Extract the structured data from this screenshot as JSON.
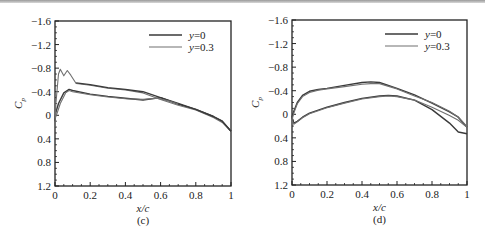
{
  "chart_data": [
    {
      "type": "line",
      "panel_label": "(c)",
      "xlabel": "x/c",
      "ylabel": "C_p",
      "xlim": [
        0,
        1
      ],
      "ylim": [
        -1.6,
        1.2
      ],
      "y_inverted": true,
      "x_ticks": [
        "0",
        "0.2",
        "0.4",
        "0.6",
        "0.8",
        "1"
      ],
      "y_ticks": [
        "-1.6",
        "-1.2",
        "-0.8",
        "-0.4",
        "0",
        "0.4",
        "0.8",
        "1.2"
      ],
      "grid": false,
      "legend_position": "upper right",
      "series": [
        {
          "name": "y=0",
          "color": "#3a3a3a",
          "width": 1.4,
          "x": [
            0,
            0.005,
            0.02,
            0.05,
            0.08,
            0.1,
            0.2,
            0.3,
            0.4,
            0.5,
            0.6,
            0.7,
            0.8,
            0.9,
            0.95,
            1.0
          ],
          "y": [
            0.1,
            -0.05,
            -0.2,
            -0.38,
            -0.44,
            -0.42,
            -0.36,
            -0.32,
            -0.29,
            -0.26,
            -0.3,
            -0.19,
            -0.1,
            0.02,
            0.1,
            0.27
          ]
        },
        {
          "name": "y=0.3",
          "color": "#707070",
          "width": 1.1,
          "x": [
            0,
            0.005,
            0.02,
            0.03,
            0.05,
            0.07,
            0.09,
            0.12,
            0.2,
            0.3,
            0.4,
            0.5,
            0.6,
            0.7,
            0.8,
            0.9,
            0.95,
            1.0
          ],
          "y": [
            0.2,
            -0.2,
            -0.7,
            -0.78,
            -0.67,
            -0.76,
            -0.68,
            -0.54,
            -0.51,
            -0.46,
            -0.43,
            -0.38,
            -0.27,
            -0.17,
            -0.09,
            0.04,
            0.12,
            0.27
          ]
        },
        {
          "name": "y=0 upper",
          "color": "#3a3a3a",
          "width": 1.4,
          "legend": false,
          "x": [
            0.12,
            0.2,
            0.3,
            0.4,
            0.5,
            0.6,
            0.7,
            0.8,
            0.9,
            0.95,
            1.0
          ],
          "y": [
            -0.55,
            -0.52,
            -0.47,
            -0.44,
            -0.4,
            -0.3,
            -0.2,
            -0.1,
            0.02,
            0.1,
            0.27
          ]
        },
        {
          "name": "y=0.3 lower",
          "color": "#707070",
          "width": 1.1,
          "legend": false,
          "x": [
            0,
            0.01,
            0.03,
            0.06,
            0.08,
            0.1,
            0.2,
            0.3,
            0.4,
            0.5,
            0.58,
            0.65,
            0.7
          ],
          "y": [
            0.05,
            -0.02,
            -0.2,
            -0.38,
            -0.42,
            -0.4,
            -0.35,
            -0.31,
            -0.28,
            -0.27,
            -0.29,
            -0.24,
            -0.19
          ]
        }
      ]
    },
    {
      "type": "line",
      "panel_label": "(d)",
      "xlabel": "x/c",
      "ylabel": "C_p",
      "xlim": [
        0,
        1
      ],
      "ylim": [
        -1.6,
        1.2
      ],
      "y_inverted": true,
      "x_ticks": [
        "0",
        "0.2",
        "0.4",
        "0.6",
        "0.8",
        "1"
      ],
      "y_ticks": [
        "-1.6",
        "-1.2",
        "-0.8",
        "-0.4",
        "0",
        "0.4",
        "0.8",
        "1.2"
      ],
      "grid": false,
      "legend_position": "upper right",
      "series": [
        {
          "name": "y=0",
          "color": "#3a3a3a",
          "width": 1.4,
          "x": [
            0,
            0.01,
            0.03,
            0.06,
            0.1,
            0.15,
            0.2,
            0.3,
            0.4,
            0.45,
            0.5,
            0.6,
            0.7,
            0.8,
            0.9,
            0.95,
            1.0
          ],
          "y": [
            0.05,
            -0.05,
            -0.2,
            -0.32,
            -0.39,
            -0.42,
            -0.44,
            -0.49,
            -0.54,
            -0.55,
            -0.54,
            -0.44,
            -0.33,
            -0.19,
            -0.04,
            0.05,
            0.22
          ],
          "lower_x": [
            0,
            0.01,
            0.03,
            0.06,
            0.1,
            0.2,
            0.3,
            0.4,
            0.5,
            0.55,
            0.6,
            0.7,
            0.8,
            0.9,
            0.95,
            1.0
          ],
          "lower_y": [
            0.05,
            0.15,
            0.12,
            0.05,
            -0.02,
            -0.12,
            -0.2,
            -0.27,
            -0.31,
            -0.32,
            -0.31,
            -0.24,
            -0.08,
            0.15,
            0.3,
            0.33
          ]
        },
        {
          "name": "y=0.3",
          "color": "#707070",
          "width": 1.1,
          "x": [
            0,
            0.01,
            0.03,
            0.06,
            0.1,
            0.15,
            0.2,
            0.3,
            0.4,
            0.45,
            0.5,
            0.6,
            0.7,
            0.8,
            0.9,
            0.95,
            1.0
          ],
          "y": [
            0.1,
            -0.02,
            -0.18,
            -0.3,
            -0.37,
            -0.41,
            -0.43,
            -0.47,
            -0.51,
            -0.52,
            -0.52,
            -0.43,
            -0.31,
            -0.2,
            -0.05,
            0.05,
            0.21
          ],
          "lower_x": [
            0,
            0.01,
            0.03,
            0.06,
            0.1,
            0.2,
            0.3,
            0.4,
            0.5,
            0.55,
            0.6,
            0.7,
            0.8,
            0.9,
            0.95,
            1.0
          ],
          "lower_y": [
            0.1,
            0.17,
            0.13,
            0.06,
            -0.01,
            -0.11,
            -0.19,
            -0.26,
            -0.3,
            -0.31,
            -0.3,
            -0.24,
            -0.12,
            0.02,
            0.1,
            0.22
          ]
        }
      ]
    }
  ],
  "panels": [
    {
      "frame": [
        55,
        21,
        231,
        186
      ],
      "caption": "(c)"
    },
    {
      "frame": [
        292,
        20,
        467,
        185
      ],
      "caption": "(d)"
    }
  ],
  "legend": [
    {
      "label": "y=0",
      "color": "#3a3a3a",
      "width": 1.6
    },
    {
      "label": "y=0.3",
      "color": "#707070",
      "width": 1.1
    }
  ]
}
